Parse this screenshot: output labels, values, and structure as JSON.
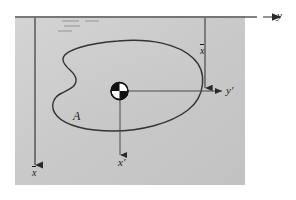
{
  "figure": {
    "background_color": "#ffffff",
    "panel_color": "#c8c8c8",
    "line_color": "#4a4a4a",
    "ink_color": "#1a1a1a",
    "labels": {
      "y_axis": "y",
      "y_prime_axis": "y′",
      "x_prime_axis": "x′",
      "area": "A",
      "x_bar_vertical": "x",
      "x_bar_left": "x"
    },
    "annotations": {
      "overbar_note": "overbar",
      "hatch_mark_count": 4
    },
    "centroid_marker": {
      "name": "centroid",
      "quadrants": [
        "black",
        "white",
        "white",
        "black"
      ]
    }
  }
}
